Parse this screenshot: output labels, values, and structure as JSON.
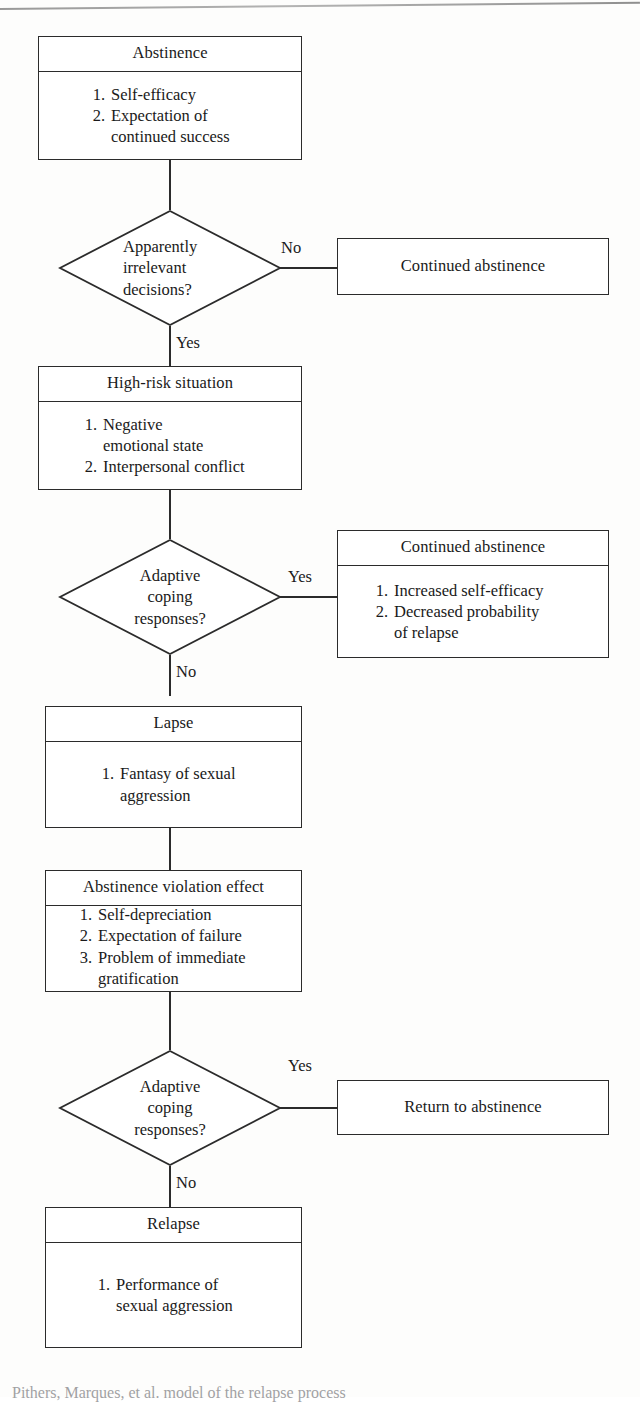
{
  "figure": {
    "type": "flowchart",
    "caption": "Pithers, Marques, et al. model of the relapse process"
  },
  "nodes": {
    "abstinence": {
      "title": "Abstinence",
      "items": [
        {
          "num": "1.",
          "text": "Self-efficacy"
        },
        {
          "num": "2.",
          "text": "Expectation of\ncontinued success"
        }
      ]
    },
    "decision_air": {
      "label": "Apparently\nirrelevant\ndecisions?"
    },
    "continued_abstinence_1": {
      "title": "Continued abstinence"
    },
    "high_risk": {
      "title": "High-risk situation",
      "items": [
        {
          "num": "1.",
          "text": "Negative\nemotional state"
        },
        {
          "num": "2.",
          "text": "Interpersonal conflict"
        }
      ]
    },
    "decision_coping_1": {
      "label": "Adaptive\ncoping\nresponses?"
    },
    "continued_abstinence_2": {
      "title": "Continued abstinence",
      "items": [
        {
          "num": "1.",
          "text": "Increased self-efficacy"
        },
        {
          "num": "2.",
          "text": "Decreased probability\nof relapse"
        }
      ]
    },
    "lapse": {
      "title": "Lapse",
      "items": [
        {
          "num": "1.",
          "text": "Fantasy of sexual\naggression"
        }
      ]
    },
    "ave": {
      "title": "Abstinence violation effect",
      "items": [
        {
          "num": "1.",
          "text": "Self-depreciation"
        },
        {
          "num": "2.",
          "text": "Expectation of failure"
        },
        {
          "num": "3.",
          "text": "Problem of immediate\ngratification"
        }
      ]
    },
    "decision_coping_2": {
      "label": "Adaptive\ncoping\nresponses?"
    },
    "return_to_abstinence": {
      "title": "Return to abstinence"
    },
    "relapse": {
      "title": "Relapse",
      "items": [
        {
          "num": "1.",
          "text": "Performance of\nsexual aggression"
        }
      ]
    }
  },
  "edge_labels": {
    "air_no": "No",
    "air_yes": "Yes",
    "coping1_yes": "Yes",
    "coping1_no": "No",
    "coping2_yes": "Yes",
    "coping2_no": "No"
  },
  "colors": {
    "stroke": "#2b2b2b",
    "text": "#1a1a1a",
    "background": "#fdfdfc"
  }
}
